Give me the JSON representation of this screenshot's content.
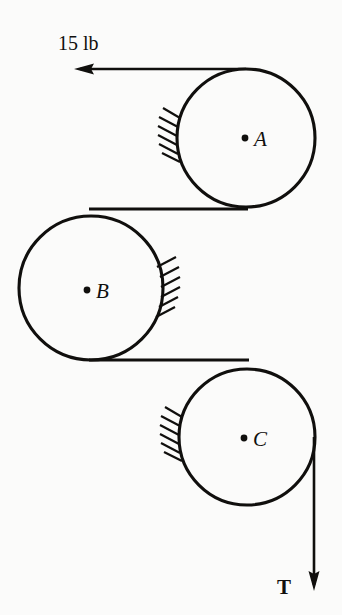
{
  "figure": {
    "background_color": "#fbfbfa",
    "ink_color": "#100f0d",
    "width": 342,
    "height": 615
  },
  "pulleys": [
    {
      "id": "A",
      "label": "A",
      "center_label": "•A",
      "cx": 246,
      "cy": 138,
      "r": 69,
      "dot_x": 245,
      "dot_y": 138,
      "label_x": 254,
      "label_y": 146,
      "support": "wall-hatching-left"
    },
    {
      "id": "B",
      "label": "B",
      "center_label": "•B",
      "cx": 91,
      "cy": 288,
      "r": 72,
      "dot_x": 87,
      "dot_y": 290,
      "label_x": 96,
      "label_y": 298,
      "support": "wall-hatching-right"
    },
    {
      "id": "C",
      "label": "C",
      "center_label": "•C",
      "cx": 247,
      "cy": 437,
      "r": 68,
      "dot_x": 244,
      "dot_y": 438,
      "label_x": 253,
      "label_y": 446,
      "support": "wall-hatching-left"
    }
  ],
  "forces": [
    {
      "id": "applied-force",
      "label": "15 lb",
      "label_x": 58,
      "label_y": 50,
      "direction": "left",
      "tail_x": 246,
      "tip_x": 74,
      "y": 69
    },
    {
      "id": "tension-force",
      "label": "T",
      "label_x": 277,
      "label_y": 594,
      "direction": "down",
      "x": 314,
      "tail_y": 437,
      "tip_y": 591
    }
  ],
  "belts": [
    {
      "id": "belt-a-to-b",
      "from": "A",
      "to": "B",
      "y": 209,
      "x_start": 91,
      "x_end": 246
    },
    {
      "id": "belt-b-to-c",
      "from": "B",
      "to": "C",
      "y": 360,
      "x_start": 91,
      "x_end": 247
    }
  ],
  "supports": [
    {
      "id": "wall-a",
      "pulley": "A",
      "side": "left"
    },
    {
      "id": "wall-b",
      "pulley": "B",
      "side": "right"
    },
    {
      "id": "wall-c",
      "pulley": "C",
      "side": "left"
    }
  ]
}
